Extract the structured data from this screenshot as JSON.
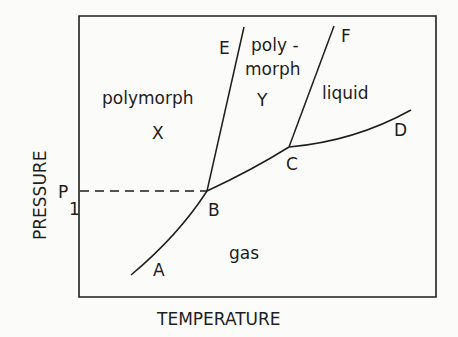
{
  "diagram": {
    "type": "phase-diagram",
    "axes": {
      "x_label": "TEMPERATURE",
      "y_label": "PRESSURE",
      "y_marker": {
        "label": "P",
        "subscript": "1"
      }
    },
    "regions": {
      "polymorph_x": {
        "line1": "polymorph",
        "line2": "X"
      },
      "polymorph_y": {
        "line1": "poly -",
        "line2": "morph",
        "line3": "Y"
      },
      "liquid": "liquid",
      "gas": "gas"
    },
    "points": {
      "A": "A",
      "B": "B",
      "C": "C",
      "D": "D",
      "E": "E",
      "F": "F"
    },
    "curves": [
      {
        "name": "A-B",
        "desc": "sublimation curve of polymorph X"
      },
      {
        "name": "B-E",
        "desc": "X/Y transition curve"
      },
      {
        "name": "B-C",
        "desc": "sublimation curve of polymorph Y"
      },
      {
        "name": "C-F",
        "desc": "melting curve of polymorph Y"
      },
      {
        "name": "C-D",
        "desc": "vaporization curve"
      }
    ],
    "colors": {
      "ink": "#1e1e1e",
      "background": "#fbfbf9"
    }
  }
}
